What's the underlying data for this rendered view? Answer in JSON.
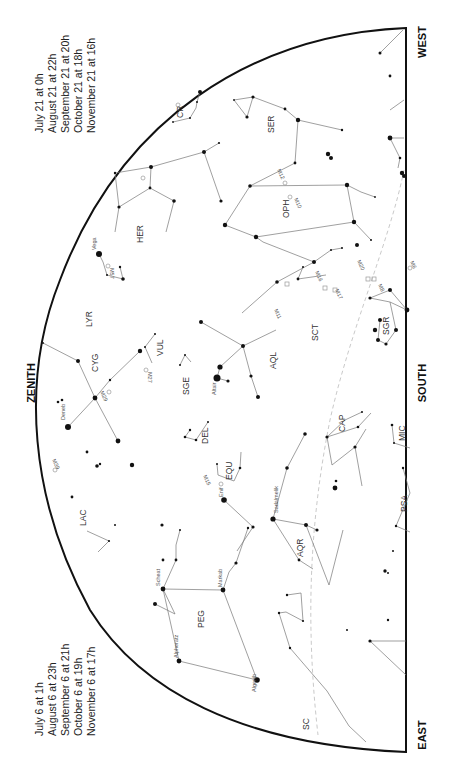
{
  "chart": {
    "type": "sky-map",
    "orientation": "rotated-90",
    "directions": {
      "zenith": "ZENITH",
      "south": "SOUTH",
      "west": "WEST",
      "east": "EAST"
    },
    "times_top": [
      {
        "date": "July 21",
        "time": "0h"
      },
      {
        "date": "August 21",
        "time": "22h"
      },
      {
        "date": "September 21",
        "time": "20h"
      },
      {
        "date": "October 21",
        "time": "18h"
      },
      {
        "date": "November 21",
        "time": "16h"
      }
    ],
    "times_bottom": [
      {
        "date": "July 6",
        "time": "1h"
      },
      {
        "date": "August 6",
        "time": "23h"
      },
      {
        "date": "September 6",
        "time": "21h"
      },
      {
        "date": "October 6",
        "time": "19h"
      },
      {
        "date": "November 6",
        "time": "17h"
      }
    ],
    "time_joiner": "at",
    "constellations": [
      "CR",
      "SER",
      "HER",
      "OPH",
      "LYR",
      "CYG",
      "VUL",
      "SGE",
      "AQL",
      "SCT",
      "SGR",
      "CAP",
      "DEL",
      "EQU",
      "LAC",
      "AQR",
      "PEG",
      "PSA",
      "MIC",
      "SC"
    ],
    "star_names": [
      "Vega",
      "Deneb",
      "Altair",
      "Enif",
      "Sadalmelik",
      "Scheat",
      "Markab",
      "Alpheratz",
      "Algenib"
    ],
    "deep_sky_objects": [
      "M57",
      "M27",
      "M29",
      "M39",
      "M15",
      "M11",
      "M16",
      "M17",
      "M20",
      "M8",
      "M10",
      "M12",
      "M6",
      "M13",
      "M92"
    ],
    "colors": {
      "background": "#ffffff",
      "horizon": "#111111",
      "constellation_lines": "#777777",
      "ecliptic": "#bbbbbb",
      "stars": "#111111"
    }
  }
}
